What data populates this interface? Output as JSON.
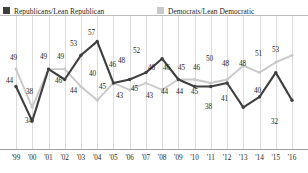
{
  "legend": {
    "republican": {
      "label": "Republicans/Lean Republican",
      "color": "#3f3f3f"
    },
    "democrat": {
      "label": "Democrats/Lean Democratic",
      "color": "#c9c9c9"
    }
  },
  "chart_data": {
    "type": "line",
    "title": "",
    "subtitle": "",
    "xlabel": "",
    "ylabel": "",
    "grid": "vertical",
    "legend_position": "top",
    "ylim": [
      30,
      60
    ],
    "x": [
      "'99",
      "'00",
      "'01",
      "'02",
      "'03",
      "'04",
      "'05",
      "'06",
      "'07",
      "'08",
      "'09",
      "'10",
      "'11",
      "'12",
      "'13",
      "'14",
      "'15",
      "'16"
    ],
    "categories": [
      "'99",
      "'00",
      "'01",
      "'02",
      "'03",
      "'04",
      "'05",
      "'06",
      "'07",
      "'08",
      "'09",
      "'10",
      "'11",
      "'12",
      "'13",
      "'14",
      "'15",
      "'16"
    ],
    "series": [
      {
        "name": "Republicans/Lean Republican",
        "color": "#3f3f3f",
        "values": [
          44,
          34,
          49,
          46,
          53,
          57,
          45,
          46,
          48,
          52,
          46,
          44,
          44,
          45,
          38,
          41,
          48,
          40
        ],
        "point_labels": [
          "44",
          "34",
          "49",
          "46",
          "53",
          "57",
          "45",
          "46",
          "48",
          "52",
          "46",
          "44",
          "44",
          "45",
          "38",
          "41",
          "48",
          "40"
        ]
      },
      {
        "name": "Democrats/Lean Democratic",
        "color": "#c9c9c9",
        "values": [
          49,
          38,
          49,
          49,
          44,
          40,
          45,
          43,
          45,
          43,
          46,
          46,
          45,
          46,
          50,
          48,
          51,
          53
        ],
        "point_labels": [
          "49",
          "38",
          "49",
          "49",
          "44",
          "40",
          "45",
          "43",
          "45",
          "43",
          "46",
          "46",
          "45",
          "46",
          "50",
          "48",
          "51",
          "53"
        ]
      }
    ],
    "final_points": {
      "republican_2016": 32,
      "democrat_2016": 53
    }
  },
  "xaxis": {
    "ticks": [
      "'99",
      "'00",
      "'01",
      "'02",
      "'03",
      "'04",
      "'05",
      "'06",
      "'07",
      "'08",
      "'09",
      "'10",
      "'11",
      "'12",
      "'13",
      "'14",
      "'15",
      "'16"
    ]
  },
  "value_labels": [
    {
      "text": "49",
      "x": 10,
      "y": 39
    },
    {
      "text": "44",
      "x": 6,
      "y": 62
    },
    {
      "text": "38",
      "x": 26,
      "y": 73
    },
    {
      "text": "34",
      "x": 25,
      "y": 102
    },
    {
      "text": "49",
      "x": 40,
      "y": 38
    },
    {
      "text": "49",
      "x": 57,
      "y": 38
    },
    {
      "text": "46",
      "x": 55,
      "y": 62
    },
    {
      "text": "53",
      "x": 70,
      "y": 25
    },
    {
      "text": "44",
      "x": 70,
      "y": 72
    },
    {
      "text": "57",
      "x": 88,
      "y": 14
    },
    {
      "text": "40",
      "x": 89,
      "y": 55
    },
    {
      "text": "45",
      "x": 99,
      "y": 68
    },
    {
      "text": "46",
      "x": 109,
      "y": 46
    },
    {
      "text": "48",
      "x": 118,
      "y": 42
    },
    {
      "text": "43",
      "x": 116,
      "y": 77
    },
    {
      "text": "52",
      "x": 133,
      "y": 32
    },
    {
      "text": "45",
      "x": 131,
      "y": 70
    },
    {
      "text": "46",
      "x": 148,
      "y": 49
    },
    {
      "text": "43",
      "x": 146,
      "y": 77
    },
    {
      "text": "46",
      "x": 163,
      "y": 49
    },
    {
      "text": "44",
      "x": 161,
      "y": 73
    },
    {
      "text": "45",
      "x": 178,
      "y": 49
    },
    {
      "text": "44",
      "x": 176,
      "y": 73
    },
    {
      "text": "46",
      "x": 193,
      "y": 49
    },
    {
      "text": "45",
      "x": 191,
      "y": 73
    },
    {
      "text": "50",
      "x": 206,
      "y": 40
    },
    {
      "text": "38",
      "x": 205,
      "y": 88
    },
    {
      "text": "48",
      "x": 222,
      "y": 45
    },
    {
      "text": "41",
      "x": 221,
      "y": 80
    },
    {
      "text": "48",
      "x": 239,
      "y": 45
    },
    {
      "text": "51",
      "x": 255,
      "y": 35
    },
    {
      "text": "40",
      "x": 254,
      "y": 72
    },
    {
      "text": "53",
      "x": 272,
      "y": 31
    },
    {
      "text": "32",
      "x": 271,
      "y": 103
    }
  ]
}
